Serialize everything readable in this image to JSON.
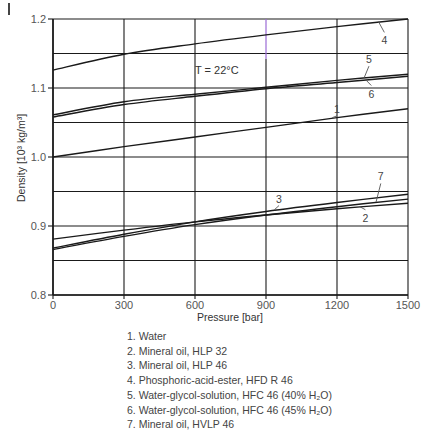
{
  "chart_data": {
    "type": "line",
    "title": "",
    "annotation": "T = 22°C",
    "xlabel": "Pressure [bar]",
    "ylabel": "Density [10³ kg/m³]",
    "xlim": [
      0,
      1500
    ],
    "ylim": [
      0.8,
      1.2
    ],
    "xticks": [
      0,
      300,
      600,
      900,
      1200,
      1500
    ],
    "xtick_labels": [
      "0",
      "300",
      "600",
      "900",
      "1200",
      "1500"
    ],
    "yticks": [
      0.8,
      0.9,
      1.0,
      1.1,
      1.2
    ],
    "ytick_labels": [
      "0.8",
      "0.9",
      "1.0",
      "1.1",
      "1.2"
    ],
    "y_minor_gridlines": [
      0.85,
      0.95,
      1.05,
      1.15
    ],
    "grid": true,
    "x": [
      0,
      300,
      600,
      900,
      1200,
      1500
    ],
    "series": [
      {
        "id": "1",
        "name": "Water",
        "values": [
          1.0,
          1.015,
          1.029,
          1.043,
          1.057,
          1.07
        ],
        "label_at": [
          1200,
          1.064
        ]
      },
      {
        "id": "2",
        "name": "Mineral oil, HLP 32",
        "values": [
          0.881,
          0.894,
          0.906,
          0.916,
          0.925,
          0.933
        ],
        "label_at": [
          1320,
          0.912
        ]
      },
      {
        "id": "3",
        "name": "Mineral oil, HLP 46",
        "values": [
          0.868,
          0.888,
          0.906,
          0.921,
          0.934,
          0.946
        ],
        "label_at": [
          955,
          0.934
        ]
      },
      {
        "id": "4",
        "name": "Phosphoric-acid-ester, HFD R 46",
        "values": [
          1.126,
          1.149,
          1.164,
          1.177,
          1.189,
          1.2
        ],
        "label_at": [
          1400,
          1.169
        ]
      },
      {
        "id": "5",
        "name": "Water-glycol-solution, HFC 46 (40% H₂O)",
        "values": [
          1.061,
          1.08,
          1.091,
          1.101,
          1.111,
          1.12
        ],
        "label_at": [
          1335,
          1.136
        ]
      },
      {
        "id": "6",
        "name": "Water-glycol-solution, HFC 46 (45% H₂O)",
        "values": [
          1.058,
          1.076,
          1.088,
          1.099,
          1.108,
          1.117
        ],
        "label_at": [
          1345,
          1.092
        ]
      },
      {
        "id": "7",
        "name": "Mineral oil, HVLP 46",
        "values": [
          0.866,
          0.885,
          0.902,
          0.916,
          0.928,
          0.939
        ],
        "label_at": [
          1385,
          0.966
        ]
      }
    ],
    "legend_position": "below"
  },
  "legend": {
    "items": [
      "1. Water",
      "2. Mineral oil, HLP 32",
      "3. Mineral oil, HLP 46",
      "4. Phosphoric-acid-ester, HFD R 46",
      "5. Water-glycol-solution, HFC 46 (40% H₂O)",
      "6. Water-glycol-solution, HFC 46 (45% H₂O)",
      "7. Mineral oil, HVLP 46"
    ]
  },
  "colors": {
    "line": "#1a1a1a",
    "grid": "#1a1a1a",
    "text": "#444444",
    "highlight_gridline": "#9b6bd6"
  }
}
